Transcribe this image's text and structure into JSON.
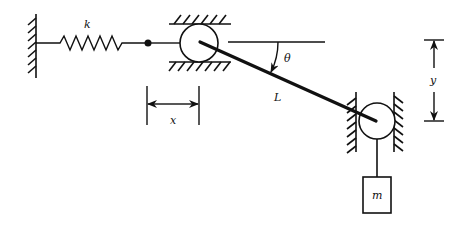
{
  "diagram": {
    "labels": {
      "spring_constant": "k",
      "angle": "θ",
      "rod_length": "L",
      "horizontal_displacement": "x",
      "vertical_displacement": "y",
      "mass": "m"
    },
    "colors": {
      "stroke": "#111111",
      "background": "#ffffff"
    }
  }
}
